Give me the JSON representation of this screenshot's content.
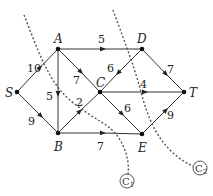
{
  "diagram": {
    "type": "flow-network",
    "nodes": [
      {
        "id": "S",
        "label": "S",
        "x": 17,
        "y": 92
      },
      {
        "id": "A",
        "label": "A",
        "x": 58,
        "y": 49
      },
      {
        "id": "B",
        "label": "B",
        "x": 58,
        "y": 133
      },
      {
        "id": "C",
        "label": "C",
        "x": 100,
        "y": 92
      },
      {
        "id": "D",
        "label": "D",
        "x": 142,
        "y": 49
      },
      {
        "id": "E",
        "label": "E",
        "x": 142,
        "y": 134
      },
      {
        "id": "T",
        "label": "T",
        "x": 184,
        "y": 92
      }
    ],
    "edges": [
      {
        "from": "S",
        "to": "A",
        "weight": "10"
      },
      {
        "from": "S",
        "to": "B",
        "weight": "9"
      },
      {
        "from": "A",
        "to": "D",
        "weight": "5"
      },
      {
        "from": "A",
        "to": "C",
        "weight": "7"
      },
      {
        "from": "A",
        "to": "B",
        "weight": "5"
      },
      {
        "from": "B",
        "to": "C",
        "weight": "2"
      },
      {
        "from": "B",
        "to": "E",
        "weight": "7"
      },
      {
        "from": "D",
        "to": "C",
        "weight": "6"
      },
      {
        "from": "D",
        "to": "T",
        "weight": "7"
      },
      {
        "from": "C",
        "to": "T",
        "weight": "4"
      },
      {
        "from": "C",
        "to": "E",
        "weight": "6"
      },
      {
        "from": "E",
        "to": "T",
        "weight": "9"
      }
    ],
    "cuts": [
      {
        "id": "C1",
        "label": "C",
        "subscript": "1"
      },
      {
        "id": "C2",
        "label": "C",
        "subscript": "2"
      }
    ]
  }
}
